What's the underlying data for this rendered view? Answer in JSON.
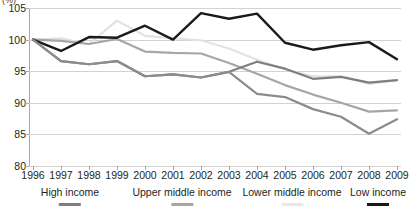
{
  "chart_data": {
    "type": "line",
    "title": "",
    "unit_label": "(%)",
    "xlabel": "",
    "ylabel": "",
    "categories": [
      1996,
      1997,
      1998,
      1999,
      2000,
      2001,
      2002,
      2003,
      2004,
      2005,
      2006,
      2007,
      2008,
      2009
    ],
    "x_tick_labels": [
      "1996",
      "1997",
      "1998",
      "1999",
      "2000",
      "2001",
      "2002",
      "2003",
      "2004",
      "2005",
      "2006",
      "2007",
      "2008",
      "2009"
    ],
    "ylim": [
      80,
      105
    ],
    "y_ticks": [
      80,
      85,
      90,
      95,
      100,
      105
    ],
    "y_tick_labels": [
      "80",
      "85",
      "90",
      "95",
      "100",
      "105"
    ],
    "grid": true,
    "legend_position": "bottom",
    "series": [
      {
        "name": "High income",
        "color": "#7f7f7f",
        "width": 2.2,
        "values": [
          100.0,
          96.6,
          96.1,
          96.6,
          94.2,
          94.5,
          94.0,
          94.9,
          96.5,
          95.4,
          93.8,
          94.1,
          93.2,
          93.6
        ]
      },
      {
        "name": "Upper middle income",
        "color": "#a6a6a6",
        "width": 2.2,
        "values": [
          100.0,
          99.8,
          99.3,
          100.1,
          98.1,
          97.9,
          97.8,
          96.3,
          94.6,
          92.8,
          91.3,
          90.0,
          88.6,
          88.8
        ]
      },
      {
        "name": "Lower middle income",
        "color": "#e2e2e2",
        "width": 2.2,
        "values": [
          100.0,
          100.2,
          99.3,
          103.0,
          100.6,
          100.2,
          99.9,
          98.6,
          96.8,
          95.3,
          94.2,
          94.2,
          93.0,
          93.6
        ]
      },
      {
        "name": "Low income",
        "color": "#1a1a1a",
        "width": 2.4,
        "values": [
          100.0,
          98.2,
          100.4,
          100.3,
          102.2,
          100.0,
          104.2,
          103.3,
          104.1,
          99.5,
          98.4,
          99.1,
          99.6,
          96.9
        ]
      }
    ],
    "overlay_series": [
      {
        "name": "Upper middle income lower track",
        "color": "#8c8c8c",
        "width": 2.2,
        "values": [
          100.0,
          96.6,
          96.1,
          96.6,
          94.2,
          94.5,
          94.0,
          94.9,
          91.4,
          90.9,
          89.0,
          87.8,
          85.1,
          87.4
        ]
      }
    ]
  },
  "legend": {
    "entries": [
      {
        "label": "High income",
        "color": "#7f7f7f"
      },
      {
        "label": "Upper middle income",
        "color": "#a6a6a6"
      },
      {
        "label": "Lower middle income",
        "color": "#e8e8e8"
      },
      {
        "label": "Low income",
        "color": "#1a1a1a"
      }
    ]
  }
}
